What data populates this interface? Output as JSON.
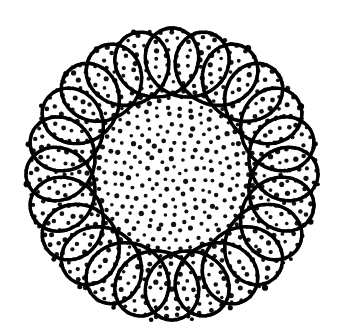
{
  "figure": {
    "kind": "epitrochoid-rosette",
    "background_color": "#ffffff",
    "ink_color": "#000000",
    "dot_color": "#111111",
    "canvas": {
      "width": 349,
      "height": 332
    },
    "center": {
      "x": 172,
      "y": 174
    },
    "outer_radius": 150,
    "petal_count": 23,
    "curve": {
      "type": "epitrochoid",
      "description": "continuous looping curve forming scalloped circular boundary",
      "R_base": 112,
      "loop_radius": 34,
      "stroke_width": 3.4,
      "samples": 2600
    },
    "dots": {
      "arrangement": "polar-rings",
      "ring_count": 17,
      "inner_radius": 8,
      "outer_radius": 142,
      "radius_px": 2.2,
      "approx_count": 560,
      "jitter": 1.6
    }
  },
  "chart_data": {
    "type": "scatter",
    "xlabel": "",
    "ylabel": "",
    "series": [
      {
        "name": "rosette-curve",
        "petals": 23,
        "R": 112,
        "r": 34
      },
      {
        "name": "dot-field",
        "rings": 17,
        "points": 560
      }
    ]
  }
}
